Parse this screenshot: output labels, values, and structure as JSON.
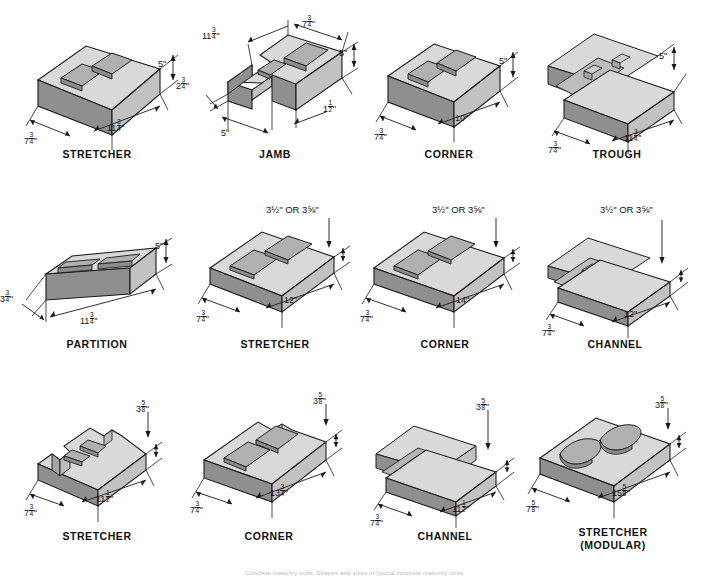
{
  "document": {
    "title": "Concrete Masonry Unit Shapes and Sizes",
    "caption": "Concrete masonry units. Shapes and sizes of typical concrete masonry units."
  },
  "colors": {
    "top_face": "#d9d9d9",
    "front_face": "#c2c2c2",
    "side_face": "#8f8f8f",
    "core_face": "#a8a8a8",
    "outline": "#1a1a1a",
    "text": "#111111",
    "background": "#ffffff"
  },
  "grid": {
    "columns": 4,
    "rows": 3
  },
  "blocks": [
    {
      "id": "r1c1",
      "label": "STRETCHER",
      "sublabel": "",
      "shape": "hollow-2core",
      "dimensions": [
        {
          "name": "height",
          "whole": "5",
          "num": "",
          "den": "",
          "unit": "\""
        },
        {
          "name": "width",
          "whole": "7",
          "num": "3",
          "den": "4",
          "unit": "\""
        },
        {
          "name": "length",
          "whole": "11",
          "num": "3",
          "den": "4",
          "unit": "\""
        }
      ]
    },
    {
      "id": "r1c2",
      "label": "JAMB",
      "sublabel": "",
      "shape": "jamb",
      "dimensions": [
        {
          "name": "height",
          "whole": "5",
          "num": "",
          "den": "",
          "unit": "\""
        },
        {
          "name": "length",
          "whole": "11",
          "num": "3",
          "den": "4",
          "unit": "\""
        },
        {
          "name": "depth",
          "whole": "7",
          "num": "3",
          "den": "4",
          "unit": "\""
        },
        {
          "name": "notch-depth",
          "whole": "2",
          "num": "3",
          "den": "4",
          "unit": "\""
        },
        {
          "name": "notch-width",
          "whole": "5",
          "num": "",
          "den": "",
          "unit": "\""
        },
        {
          "name": "jamb-slot",
          "whole": "1",
          "num": "1",
          "den": "2",
          "unit": "\""
        }
      ]
    },
    {
      "id": "r1c3",
      "label": "CORNER",
      "sublabel": "",
      "shape": "hollow-2core",
      "dimensions": [
        {
          "name": "height",
          "whole": "5",
          "num": "",
          "den": "",
          "unit": "\""
        },
        {
          "name": "width",
          "whole": "7",
          "num": "3",
          "den": "4",
          "unit": "\""
        },
        {
          "name": "length",
          "whole": "10",
          "num": "",
          "den": "",
          "unit": "\""
        }
      ]
    },
    {
      "id": "r1c4",
      "label": "TROUGH",
      "sublabel": "",
      "shape": "trough",
      "dimensions": [
        {
          "name": "height",
          "whole": "5",
          "num": "",
          "den": "",
          "unit": "\""
        },
        {
          "name": "width",
          "whole": "7",
          "num": "3",
          "den": "4",
          "unit": "\""
        },
        {
          "name": "length",
          "whole": "11",
          "num": "3",
          "den": "4",
          "unit": "\""
        }
      ]
    },
    {
      "id": "r2c1",
      "label": "PARTITION",
      "sublabel": "",
      "shape": "partition",
      "dimensions": [
        {
          "name": "height",
          "whole": "5",
          "num": "",
          "den": "",
          "unit": "\""
        },
        {
          "name": "width",
          "whole": "3",
          "num": "3",
          "den": "4",
          "unit": "\""
        },
        {
          "name": "length",
          "whole": "11",
          "num": "3",
          "den": "4",
          "unit": "\""
        }
      ]
    },
    {
      "id": "r2c2",
      "label": "STRETCHER",
      "sublabel": "",
      "shape": "hollow-2core-low",
      "dimensions": [
        {
          "name": "height",
          "text": "3½\" OR 3⅝\""
        },
        {
          "name": "width",
          "whole": "7",
          "num": "3",
          "den": "4",
          "unit": "\""
        },
        {
          "name": "length",
          "whole": "12",
          "num": "",
          "den": "",
          "unit": "\""
        }
      ]
    },
    {
      "id": "r2c3",
      "label": "CORNER",
      "sublabel": "",
      "shape": "hollow-2core-low",
      "dimensions": [
        {
          "name": "height",
          "text": "3½\" OR 3⅝\""
        },
        {
          "name": "width",
          "whole": "7",
          "num": "3",
          "den": "4",
          "unit": "\""
        },
        {
          "name": "length",
          "whole": "14",
          "num": "",
          "den": "",
          "unit": "\""
        }
      ]
    },
    {
      "id": "r2c4",
      "label": "CHANNEL",
      "sublabel": "",
      "shape": "channel-low",
      "dimensions": [
        {
          "name": "height",
          "text": "3½\" OR 3⅝\""
        },
        {
          "name": "width",
          "whole": "7",
          "num": "3",
          "den": "4",
          "unit": "\""
        },
        {
          "name": "length",
          "whole": "12",
          "num": "",
          "den": "",
          "unit": "\""
        }
      ]
    },
    {
      "id": "r3c1",
      "label": "STRETCHER",
      "sublabel": "",
      "shape": "notched-stretcher",
      "dimensions": [
        {
          "name": "height",
          "whole": "3",
          "num": "5",
          "den": "8",
          "unit": "\""
        },
        {
          "name": "width",
          "whole": "7",
          "num": "3",
          "den": "4",
          "unit": "\""
        },
        {
          "name": "length",
          "whole": "11",
          "num": "1",
          "den": "2",
          "unit": "\""
        }
      ]
    },
    {
      "id": "r3c2",
      "label": "CORNER",
      "sublabel": "",
      "shape": "notched-corner",
      "dimensions": [
        {
          "name": "height",
          "whole": "3",
          "num": "5",
          "den": "8",
          "unit": "\""
        },
        {
          "name": "width",
          "whole": "7",
          "num": "3",
          "den": "4",
          "unit": "\""
        },
        {
          "name": "length",
          "whole": "13",
          "num": "3",
          "den": "4",
          "unit": "\""
        }
      ]
    },
    {
      "id": "r3c3",
      "label": "CHANNEL",
      "sublabel": "",
      "shape": "channel-flat",
      "dimensions": [
        {
          "name": "height",
          "whole": "3",
          "num": "5",
          "den": "8",
          "unit": "\""
        },
        {
          "name": "width",
          "whole": "7",
          "num": "3",
          "den": "4",
          "unit": "\""
        },
        {
          "name": "length",
          "whole": "11",
          "num": "1",
          "den": "2",
          "unit": "\""
        }
      ]
    },
    {
      "id": "r3c4",
      "label": "STRETCHER",
      "sublabel": "(MODULAR)",
      "shape": "modular-oval",
      "dimensions": [
        {
          "name": "height",
          "whole": "3",
          "num": "5",
          "den": "8",
          "unit": "\""
        },
        {
          "name": "width",
          "whole": "7",
          "num": "5",
          "den": "8",
          "unit": "\""
        },
        {
          "name": "length",
          "whole": "15",
          "num": "5",
          "den": "8",
          "unit": "\""
        }
      ]
    }
  ]
}
